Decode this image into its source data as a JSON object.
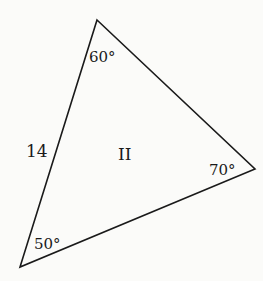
{
  "diagram": {
    "type": "triangle",
    "label": "II",
    "stroke_color": "#1a1a1a",
    "vertices": [
      {
        "name": "top",
        "x": 97,
        "y": 20,
        "angle_label": "60°",
        "label_x": 89,
        "label_y": 62
      },
      {
        "name": "right",
        "x": 255,
        "y": 169,
        "angle_label": "70°",
        "label_x": 209,
        "label_y": 175
      },
      {
        "name": "bottom-left",
        "x": 20,
        "y": 267,
        "angle_label": "50°",
        "label_x": 34,
        "label_y": 249
      }
    ],
    "side_label": {
      "text": "14",
      "x": 26,
      "y": 157
    },
    "center_label": {
      "text": "II",
      "x": 118,
      "y": 160
    }
  }
}
